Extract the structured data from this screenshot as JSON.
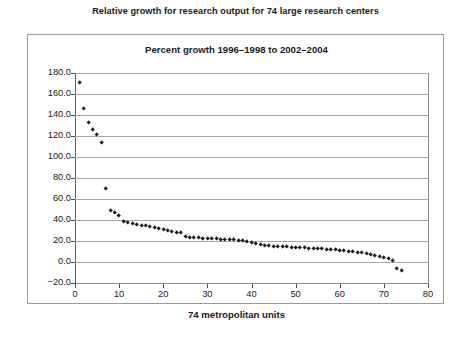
{
  "figure": {
    "caption": "Relative growth for research output for 74 large research centers"
  },
  "chart_data": {
    "type": "scatter",
    "title": "Percent growth 1996–1998 to 2002–2004",
    "xlabel": "74 metropolitan units",
    "ylabel": "",
    "xlim": [
      0,
      80
    ],
    "ylim": [
      -20.0,
      180.0
    ],
    "xticks": [
      0,
      10,
      20,
      30,
      40,
      50,
      60,
      70,
      80
    ],
    "xtick_labels": [
      "0",
      "10",
      "20",
      "30",
      "40",
      "50",
      "60",
      "70",
      "80"
    ],
    "yticks": [
      -20.0,
      0.0,
      20.0,
      40.0,
      60.0,
      80.0,
      100.0,
      120.0,
      140.0,
      160.0,
      180.0
    ],
    "ytick_labels": [
      "−20.0",
      "0.0",
      "20.0",
      "40.0",
      "60.0",
      "80.0",
      "100.0",
      "120.0",
      "140.0",
      "160.0",
      "180.0"
    ],
    "grid": true,
    "grid_axis": "y",
    "legend": false,
    "marker": "diamond",
    "marker_color": "#1c1c1c",
    "n_points": 74,
    "x": [
      1,
      2,
      3,
      4,
      5,
      6,
      7,
      8,
      9,
      10,
      11,
      12,
      13,
      14,
      15,
      16,
      17,
      18,
      19,
      20,
      21,
      22,
      23,
      24,
      25,
      26,
      27,
      28,
      29,
      30,
      31,
      32,
      33,
      34,
      35,
      36,
      37,
      38,
      39,
      40,
      41,
      42,
      43,
      44,
      45,
      46,
      47,
      48,
      49,
      50,
      51,
      52,
      53,
      54,
      55,
      56,
      57,
      58,
      59,
      60,
      61,
      62,
      63,
      64,
      65,
      66,
      67,
      68,
      69,
      70,
      71,
      72,
      73,
      74
    ],
    "y": [
      171.0,
      146.0,
      133.0,
      126.0,
      121.0,
      114.0,
      70.0,
      48.5,
      47.0,
      44.5,
      38.0,
      37.0,
      36.5,
      36.0,
      35.0,
      34.5,
      34.0,
      33.0,
      32.0,
      31.0,
      30.0,
      29.0,
      28.0,
      27.5,
      24.0,
      23.5,
      23.0,
      23.0,
      22.5,
      22.5,
      22.0,
      22.0,
      21.5,
      21.5,
      21.0,
      21.0,
      20.5,
      20.0,
      19.5,
      18.5,
      17.0,
      16.5,
      16.0,
      15.5,
      15.0,
      15.0,
      14.5,
      14.5,
      14.0,
      14.0,
      13.5,
      13.5,
      13.0,
      13.0,
      12.5,
      12.5,
      12.0,
      12.0,
      11.5,
      11.0,
      10.5,
      10.0,
      9.5,
      9.0,
      8.5,
      8.0,
      7.0,
      6.0,
      5.0,
      4.0,
      3.0,
      1.5,
      -6.0,
      -8.5
    ]
  }
}
